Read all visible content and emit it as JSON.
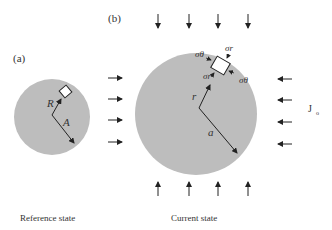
{
  "panels": {
    "a": {
      "label": "(a)",
      "radius_label": "R",
      "outer_label": "A",
      "caption": "Reference state"
    },
    "b": {
      "label": "(b)",
      "radius_label": "r",
      "outer_label": "a",
      "caption": "Current state",
      "stress_labels": {
        "sigma_theta_left": "σθ",
        "sigma_r_top": "σr",
        "sigma_r_bottom": "σr",
        "sigma_theta_right": "σθ"
      }
    }
  },
  "side_label": "J",
  "side_label_sub": "o",
  "colors": {
    "disk": "#bdbdbd",
    "arrow": "#222222",
    "text": "#333333"
  }
}
